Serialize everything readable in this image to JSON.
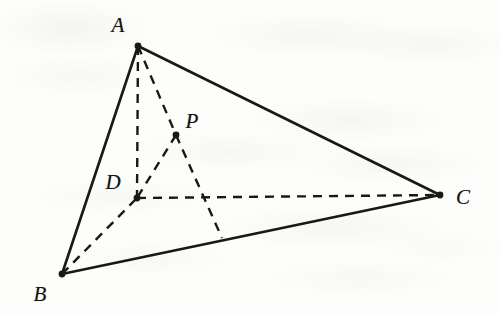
{
  "figure": {
    "kind": "solid-geometry-diagram",
    "canvas": {
      "width": 500,
      "height": 316
    },
    "background_color": "#fdfdfc",
    "ink_color": "#1a1814",
    "points": {
      "A": {
        "label": "A",
        "x": 138,
        "y": 46,
        "label_x": 118,
        "label_y": 25,
        "dot": true
      },
      "B": {
        "label": "B",
        "x": 62,
        "y": 274,
        "label_x": 40,
        "label_y": 294,
        "dot": true
      },
      "C": {
        "label": "C",
        "x": 440,
        "y": 195,
        "label_x": 463,
        "label_y": 197,
        "dot": true
      },
      "D": {
        "label": "D",
        "x": 137,
        "y": 198,
        "label_x": 113,
        "label_y": 182,
        "dot": true
      },
      "P": {
        "label": "P",
        "x": 176,
        "y": 135,
        "label_x": 192,
        "label_y": 121,
        "dot": true
      },
      "F": {
        "label": "",
        "x": 222,
        "y": 238,
        "label_x": 0,
        "label_y": 0,
        "dot": false
      }
    },
    "solid_edges": [
      {
        "name": "edge-AB",
        "from": "A",
        "to": "B"
      },
      {
        "name": "edge-AC",
        "from": "A",
        "to": "C"
      },
      {
        "name": "edge-BC",
        "from": "B",
        "to": "C"
      }
    ],
    "dashed_edges": [
      {
        "name": "edge-AD",
        "from": "A",
        "to": "D"
      },
      {
        "name": "edge-BD",
        "from": "B",
        "to": "D"
      },
      {
        "name": "edge-DC",
        "from": "D",
        "to": "C"
      },
      {
        "name": "edge-AP",
        "from": "A",
        "to": "P"
      },
      {
        "name": "edge-PD",
        "from": "P",
        "to": "D"
      },
      {
        "name": "edge-PF",
        "from": "P",
        "to": "F"
      }
    ],
    "stroke": {
      "solid_width": 2.6,
      "dashed_width": 2.4,
      "dash_pattern": "9 7",
      "dot_radius": 3.4
    }
  }
}
